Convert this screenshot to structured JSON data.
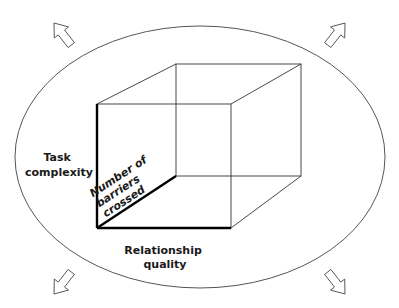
{
  "diagram": {
    "labels": {
      "task_complexity": [
        "Task",
        "complexity"
      ],
      "relationship_quality": [
        "Relationship",
        "quality"
      ],
      "barriers": [
        "Number of",
        "barriers",
        "crossed"
      ]
    },
    "shapes": {
      "ellipse": {
        "cx": 200,
        "cy": 157,
        "rx": 185,
        "ry": 131
      },
      "cube": {
        "front": {
          "x1": 97,
          "y1": 104,
          "x2": 231,
          "y2": 228
        },
        "back": {
          "x1": 176,
          "y1": 64,
          "x2": 301,
          "y2": 176
        }
      },
      "arrows": [
        "up-left",
        "up-right",
        "down-left",
        "down-right"
      ]
    },
    "colors": {
      "line": "#333333",
      "axis": "#000000",
      "background": "#ffffff"
    }
  }
}
